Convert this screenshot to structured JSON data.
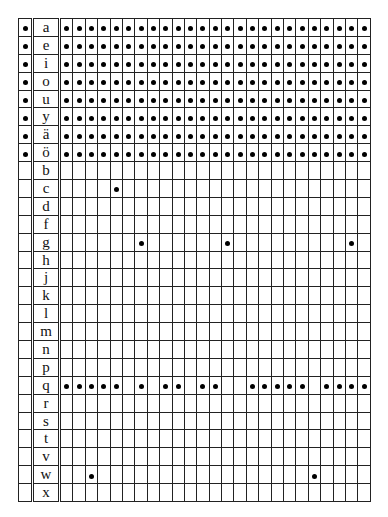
{
  "table": {
    "num_data_columns": 25,
    "rows": [
      {
        "label": "a",
        "marked": true,
        "dots": "all"
      },
      {
        "label": "e",
        "marked": true,
        "dots": "all"
      },
      {
        "label": "i",
        "marked": true,
        "dots": "all"
      },
      {
        "label": "o",
        "marked": true,
        "dots": "all"
      },
      {
        "label": "u",
        "marked": true,
        "dots": "all"
      },
      {
        "label": "y",
        "marked": true,
        "dots": "all"
      },
      {
        "label": "ä",
        "marked": true,
        "dots": "all"
      },
      {
        "label": "ö",
        "marked": true,
        "dots": "all"
      },
      {
        "label": "b",
        "marked": false,
        "dots": []
      },
      {
        "label": "c",
        "marked": false,
        "dots": [
          4
        ]
      },
      {
        "label": "d",
        "marked": false,
        "dots": []
      },
      {
        "label": "f",
        "marked": false,
        "dots": []
      },
      {
        "label": "g",
        "marked": false,
        "dots": [
          6,
          13,
          23
        ]
      },
      {
        "label": "h",
        "marked": false,
        "dots": []
      },
      {
        "label": "j",
        "marked": false,
        "dots": []
      },
      {
        "label": "k",
        "marked": false,
        "dots": []
      },
      {
        "label": "l",
        "marked": false,
        "dots": []
      },
      {
        "label": "m",
        "marked": false,
        "dots": []
      },
      {
        "label": "n",
        "marked": false,
        "dots": []
      },
      {
        "label": "p",
        "marked": false,
        "dots": []
      },
      {
        "label": "q",
        "marked": false,
        "dots": [
          0,
          1,
          2,
          3,
          4,
          6,
          8,
          9,
          11,
          12,
          15,
          16,
          17,
          18,
          19,
          21,
          22,
          23,
          24
        ]
      },
      {
        "label": "r",
        "marked": false,
        "dots": []
      },
      {
        "label": "s",
        "marked": false,
        "dots": []
      },
      {
        "label": "t",
        "marked": false,
        "dots": []
      },
      {
        "label": "v",
        "marked": false,
        "dots": []
      },
      {
        "label": "w",
        "marked": false,
        "dots": [
          2,
          20
        ]
      },
      {
        "label": "x",
        "marked": false,
        "dots": []
      }
    ]
  }
}
